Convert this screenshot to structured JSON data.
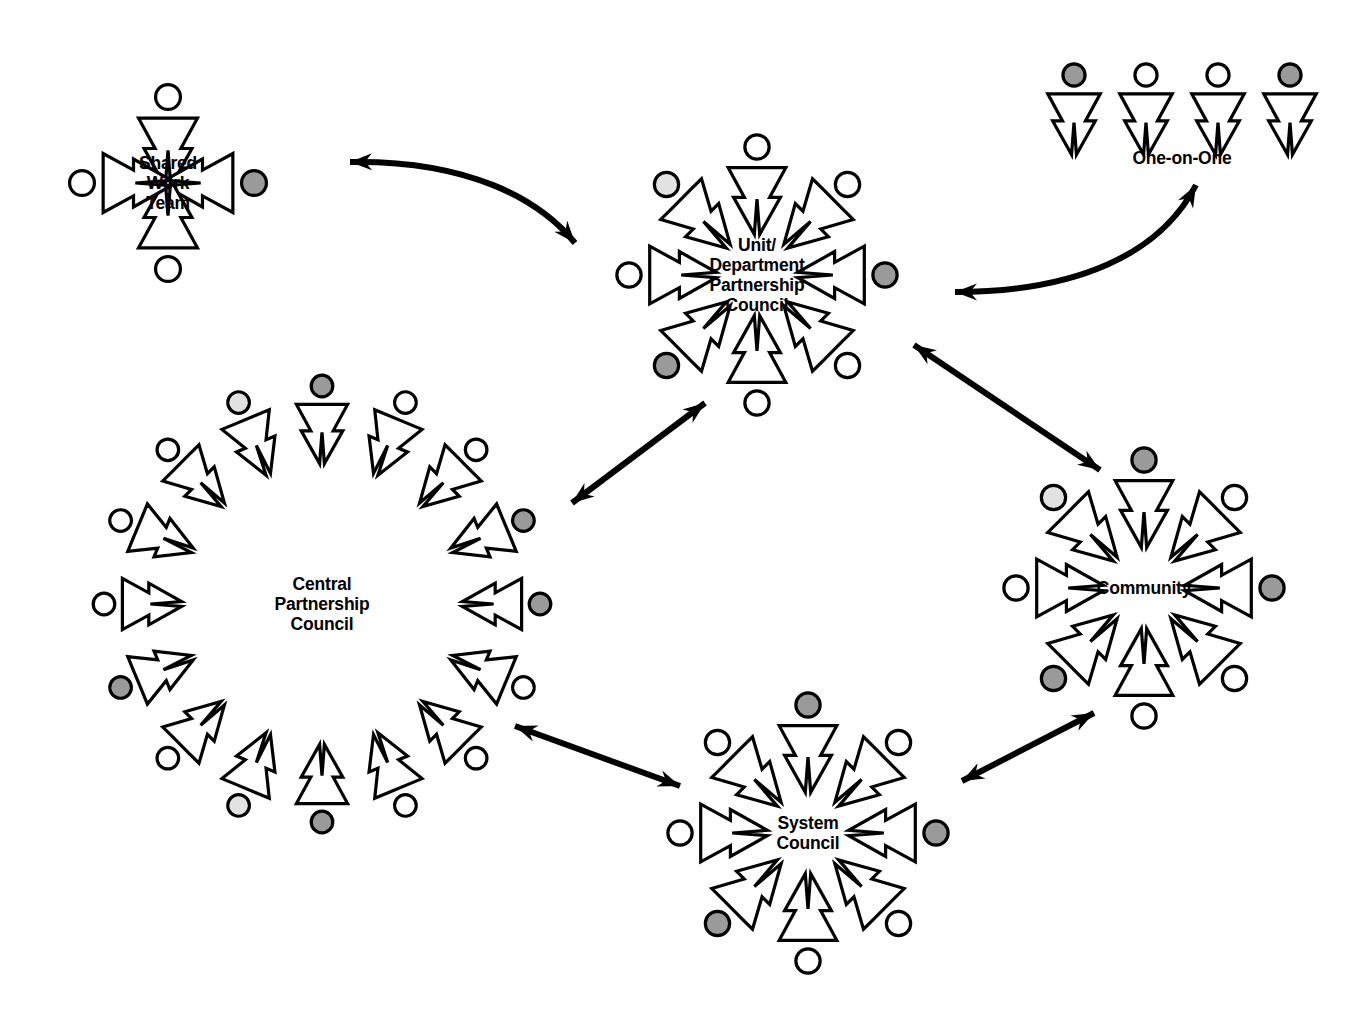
{
  "diagram": {
    "type": "radial-cluster-network",
    "background_color": "#ffffff",
    "line_color": "#000000",
    "head_colors": {
      "white": "#ffffff",
      "gray": "#9a9a9a",
      "light_gray": "#e2e2e2"
    },
    "clusters": [
      {
        "id": "shared-work-team",
        "label": "Shared\nWork\nTeam",
        "label_lines": [
          "Shared",
          "Work",
          "Team"
        ],
        "cx": 168,
        "cy": 183,
        "radius": 86,
        "label_radius": 0,
        "member_count": 4,
        "start_angle": -90,
        "members": [
          {
            "angle": -90,
            "head": "white"
          },
          {
            "angle": 0,
            "head": "gray"
          },
          {
            "angle": 90,
            "head": "white"
          },
          {
            "angle": 180,
            "head": "white"
          }
        ]
      },
      {
        "id": "one-on-one",
        "label": "One-on-One",
        "label_lines": [
          "One-on-One"
        ],
        "cx": 1182,
        "cy": 75,
        "type": "row",
        "member_count": 4,
        "members": [
          {
            "head": "gray"
          },
          {
            "head": "white"
          },
          {
            "head": "white"
          },
          {
            "head": "gray"
          }
        ]
      },
      {
        "id": "unit-department-partnership-council",
        "label": "Unit/\nDepartment\nPartnership\nCouncil",
        "label_lines": [
          "Unit/",
          "Department",
          "Partnership",
          "Council"
        ],
        "cx": 757,
        "cy": 275,
        "radius": 128,
        "member_count": 8,
        "members": [
          {
            "angle": -90,
            "head": "white"
          },
          {
            "angle": -45,
            "head": "white"
          },
          {
            "angle": 0,
            "head": "gray"
          },
          {
            "angle": 45,
            "head": "white"
          },
          {
            "angle": 90,
            "head": "white"
          },
          {
            "angle": 135,
            "head": "gray"
          },
          {
            "angle": 180,
            "head": "white"
          },
          {
            "angle": 225,
            "head": "light_gray"
          }
        ]
      },
      {
        "id": "central-partnership-council",
        "label": "Central\nPartnership\nCouncil",
        "label_lines": [
          "Central",
          "Partnership",
          "Council"
        ],
        "cx": 322,
        "cy": 604,
        "radius": 218,
        "member_count": 16,
        "members": [
          {
            "angle": -90,
            "head": "gray"
          },
          {
            "angle": -67.5,
            "head": "white"
          },
          {
            "angle": -45,
            "head": "white"
          },
          {
            "angle": -22.5,
            "head": "gray"
          },
          {
            "angle": 0,
            "head": "gray"
          },
          {
            "angle": 22.5,
            "head": "white"
          },
          {
            "angle": 45,
            "head": "white"
          },
          {
            "angle": 67.5,
            "head": "white"
          },
          {
            "angle": 90,
            "head": "gray"
          },
          {
            "angle": 112.5,
            "head": "light_gray"
          },
          {
            "angle": 135,
            "head": "white"
          },
          {
            "angle": 157.5,
            "head": "gray"
          },
          {
            "angle": 180,
            "head": "white"
          },
          {
            "angle": 202.5,
            "head": "white"
          },
          {
            "angle": 225,
            "head": "white"
          },
          {
            "angle": 247.5,
            "head": "light_gray"
          }
        ]
      },
      {
        "id": "community",
        "label": "Community",
        "label_lines": [
          "Community"
        ],
        "cx": 1144,
        "cy": 588,
        "radius": 128,
        "member_count": 8,
        "members": [
          {
            "angle": -90,
            "head": "gray"
          },
          {
            "angle": -45,
            "head": "white"
          },
          {
            "angle": 0,
            "head": "gray"
          },
          {
            "angle": 45,
            "head": "white"
          },
          {
            "angle": 90,
            "head": "white"
          },
          {
            "angle": 135,
            "head": "gray"
          },
          {
            "angle": 180,
            "head": "white"
          },
          {
            "angle": 225,
            "head": "light_gray"
          }
        ]
      },
      {
        "id": "system-council",
        "label": "System\nCouncil",
        "label_lines": [
          "System",
          "Council"
        ],
        "cx": 808,
        "cy": 833,
        "radius": 128,
        "member_count": 8,
        "members": [
          {
            "angle": -90,
            "head": "gray"
          },
          {
            "angle": -45,
            "head": "white"
          },
          {
            "angle": 0,
            "head": "gray"
          },
          {
            "angle": 45,
            "head": "white"
          },
          {
            "angle": 90,
            "head": "white"
          },
          {
            "angle": 135,
            "head": "gray"
          },
          {
            "angle": 180,
            "head": "white"
          },
          {
            "angle": 225,
            "head": "white"
          }
        ]
      }
    ],
    "connectors": [
      {
        "id": "swt-udpc",
        "from": "unit-department-partnership-council",
        "to": "shared-work-team",
        "style": "curved",
        "arrowheads": "both",
        "path": "M 350 162 C 470 160 540 200 575 243"
      },
      {
        "id": "udpc-one-on-one",
        "from": "unit-department-partnership-council",
        "to": "one-on-one",
        "style": "curved",
        "arrowheads": "both",
        "path": "M 955 292 C 1075 292 1160 255 1196 185"
      },
      {
        "id": "cpc-udpc",
        "from": "central-partnership-council",
        "to": "unit-department-partnership-council",
        "style": "straight",
        "arrowheads": "both",
        "path": "M 572 503 L 705 403"
      },
      {
        "id": "udpc-community",
        "from": "unit-department-partnership-council",
        "to": "community",
        "style": "straight",
        "arrowheads": "both",
        "path": "M 914 345 L 1100 470"
      },
      {
        "id": "cpc-system",
        "from": "central-partnership-council",
        "to": "system-council",
        "style": "straight",
        "arrowheads": "both",
        "path": "M 515 726 L 680 786"
      },
      {
        "id": "system-community",
        "from": "system-council",
        "to": "community",
        "style": "straight",
        "arrowheads": "both",
        "path": "M 962 781 L 1094 713"
      }
    ]
  }
}
